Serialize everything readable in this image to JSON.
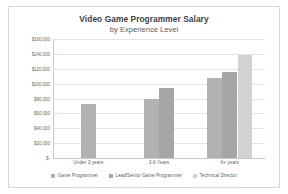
{
  "chart_data": {
    "type": "bar",
    "title": "Video Game Programmer Salary",
    "subtitle": "by Experience Level",
    "xlabel": "",
    "ylabel": "",
    "categories": [
      "Under 3 years",
      "3-6 Years",
      "6+ years"
    ],
    "series": [
      {
        "name": "Game Programmer",
        "color": "#b2b2b2",
        "values": [
          72000,
          80000,
          107000
        ]
      },
      {
        "name": "Lead/Senior Game Programmer",
        "color": "#a6a6a6",
        "values": [
          null,
          94000,
          115000
        ]
      },
      {
        "name": "Technical Director",
        "color": "#d2d2d2",
        "values": [
          null,
          null,
          138000
        ]
      }
    ],
    "ylim": [
      0,
      160000
    ],
    "ytick_values": [
      0,
      20000,
      40000,
      60000,
      80000,
      100000,
      120000,
      140000,
      160000
    ],
    "ytick_labels": [
      "$-",
      "$20,000",
      "$40,000",
      "$60,000",
      "$80,000",
      "$100,000",
      "$120,000",
      "$140,000",
      "$160,000"
    ],
    "grid": true,
    "legend_position": "bottom",
    "gridline_color": "#e4e4e4",
    "axis_color": "#c9c9c9",
    "background": "#ffffff",
    "border_color": "#d9d9d9"
  }
}
